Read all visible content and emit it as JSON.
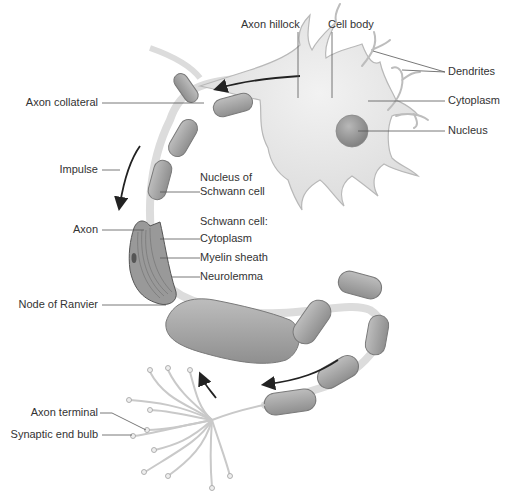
{
  "colors": {
    "cell_body": "#e6e6e6",
    "cell_outline": "#b8b8b8",
    "nucleus": "#9a9a9a",
    "schwann": "#a8a8a8",
    "schwann_outline": "#7a7a7a",
    "node": "#ececec",
    "leader": "#555555",
    "arrow": "#222222",
    "text": "#333333"
  },
  "labels": {
    "axon_hillock": "Axon hillock",
    "cell_body": "Cell body",
    "dendrites": "Dendrites",
    "cytoplasm": "Cytoplasm",
    "nucleus": "Nucleus",
    "axon_collateral": "Axon collateral",
    "impulse": "Impulse",
    "nucleus_of_schwann_1": "Nucleus of",
    "nucleus_of_schwann_2": "Schwann cell",
    "schwann_cell": "Schwann cell:",
    "schwann_cytoplasm": "Cytoplasm",
    "myelin_sheath": "Myelin sheath",
    "neurolemma": "Neurolemma",
    "axon": "Axon",
    "node_of_ranvier": "Node of Ranvier",
    "axon_terminal": "Axon terminal",
    "synaptic_end_bulb": "Synaptic end bulb"
  }
}
